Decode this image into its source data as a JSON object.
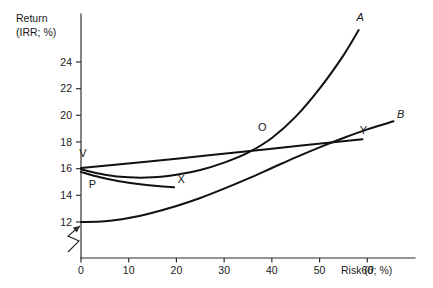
{
  "chart_data": {
    "type": "line",
    "title": "",
    "xlabel": "Risk (θ; %)",
    "ylabel": "Return (IRR; %)",
    "ylabel_line1": "Return",
    "ylabel_line2": "(IRR; %)",
    "xlim": [
      0,
      70
    ],
    "ylim": [
      11.4,
      27.6
    ],
    "grid": false,
    "legend_position": "none",
    "axis_break": {
      "axis": "y",
      "note": "zigzag break on the vertical axis below the value 12"
    },
    "xticks": [
      0,
      10,
      20,
      30,
      40,
      50,
      60
    ],
    "xtick_labels": [
      "0",
      "10",
      "20",
      "30",
      "40",
      "50",
      "60"
    ],
    "yticks": [
      12,
      14,
      16,
      18,
      20,
      22,
      24
    ],
    "ytick_labels": [
      "12",
      "14",
      "16",
      "18",
      "20",
      "22",
      "24"
    ],
    "series": [
      {
        "name": "A",
        "label": "A",
        "label_style": "italic",
        "label_point": {
          "x": 58.5,
          "y": 27.1
        },
        "description": "steeply rising convex curve from the origin point V",
        "points": [
          {
            "x": 0.0,
            "y": 15.95
          },
          {
            "x": 5.0,
            "y": 15.55
          },
          {
            "x": 10.0,
            "y": 15.35
          },
          {
            "x": 15.0,
            "y": 15.35
          },
          {
            "x": 20.0,
            "y": 15.55
          },
          {
            "x": 25.0,
            "y": 15.9
          },
          {
            "x": 30.0,
            "y": 16.45
          },
          {
            "x": 35.0,
            "y": 17.2
          },
          {
            "x": 40.0,
            "y": 18.3
          },
          {
            "x": 45.0,
            "y": 19.9
          },
          {
            "x": 50.0,
            "y": 22.0
          },
          {
            "x": 55.0,
            "y": 24.5
          },
          {
            "x": 58.2,
            "y": 26.4
          }
        ]
      },
      {
        "name": "B",
        "label": "B",
        "label_style": "italic",
        "label_point": {
          "x": 67.0,
          "y": 19.8
        },
        "description": "gently rising convex curve starting at 12",
        "points": [
          {
            "x": 0.0,
            "y": 12.0
          },
          {
            "x": 5.0,
            "y": 12.05
          },
          {
            "x": 10.0,
            "y": 12.3
          },
          {
            "x": 15.0,
            "y": 12.7
          },
          {
            "x": 20.0,
            "y": 13.2
          },
          {
            "x": 25.0,
            "y": 13.8
          },
          {
            "x": 30.0,
            "y": 14.5
          },
          {
            "x": 35.0,
            "y": 15.25
          },
          {
            "x": 40.0,
            "y": 16.05
          },
          {
            "x": 45.0,
            "y": 16.85
          },
          {
            "x": 50.0,
            "y": 17.6
          },
          {
            "x": 55.0,
            "y": 18.3
          },
          {
            "x": 60.0,
            "y": 18.95
          },
          {
            "x": 65.5,
            "y": 19.55
          }
        ]
      },
      {
        "name": "VY",
        "label": "Y",
        "label_style": "upright",
        "label_point": {
          "x": 59.2,
          "y": 18.6
        },
        "description": "near-straight shallow rising line from V to Y",
        "points": [
          {
            "x": 0.0,
            "y": 16.05
          },
          {
            "x": 20.0,
            "y": 16.75
          },
          {
            "x": 40.0,
            "y": 17.5
          },
          {
            "x": 59.0,
            "y": 18.2
          }
        ]
      },
      {
        "name": "PX",
        "label": "X",
        "label_style": "upright",
        "label_point": {
          "x": 21.0,
          "y": 14.95
        },
        "description": "shallow declining curve from P flattening toward X",
        "points": [
          {
            "x": 0.0,
            "y": 15.75
          },
          {
            "x": 4.0,
            "y": 15.35
          },
          {
            "x": 8.0,
            "y": 15.05
          },
          {
            "x": 12.0,
            "y": 14.85
          },
          {
            "x": 16.0,
            "y": 14.7
          },
          {
            "x": 19.5,
            "y": 14.6
          }
        ]
      }
    ],
    "annotations": [
      {
        "label": "V",
        "style": "upright",
        "x": 0.4,
        "y": 16.9,
        "description": "vertex label at the left origin of curves A and Y"
      },
      {
        "label": "P",
        "style": "upright",
        "x": 2.4,
        "y": 14.55,
        "description": "label below the left origin of curve X"
      },
      {
        "label": "O",
        "style": "upright",
        "x": 38.0,
        "y": 18.85,
        "description": "label at the crossing of curve A and line VY"
      },
      {
        "label": "X",
        "style": "upright",
        "x": 21.0,
        "y": 14.95,
        "description": "endpoint label of curve PX"
      },
      {
        "label": "Y",
        "style": "upright",
        "x": 59.2,
        "y": 18.6,
        "description": "endpoint label of line VY"
      },
      {
        "label": "A",
        "style": "italic",
        "x": 58.5,
        "y": 27.1,
        "description": "endpoint label of curve A"
      },
      {
        "label": "B",
        "style": "italic",
        "x": 67.0,
        "y": 19.8,
        "description": "endpoint label of curve B"
      }
    ]
  }
}
